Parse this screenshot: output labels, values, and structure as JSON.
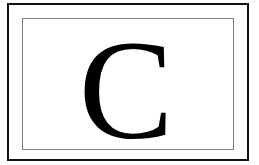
{
  "card": {
    "letter": "C",
    "colors": {
      "outer_border": "#111111",
      "inner_border": "#808080",
      "background": "#ffffff",
      "text": "#000000"
    }
  }
}
